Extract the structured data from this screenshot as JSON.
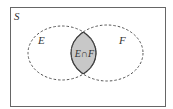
{
  "diagram": {
    "type": "venn",
    "universe_label": "S",
    "sets": [
      {
        "label": "E"
      },
      {
        "label": "F"
      }
    ],
    "intersection_label": "E∩F",
    "colors": {
      "border": "#555555",
      "dashed": "#555555",
      "intersection_fill": "#c8c8c8",
      "intersection_stroke": "#333333",
      "background": "#ffffff"
    }
  }
}
